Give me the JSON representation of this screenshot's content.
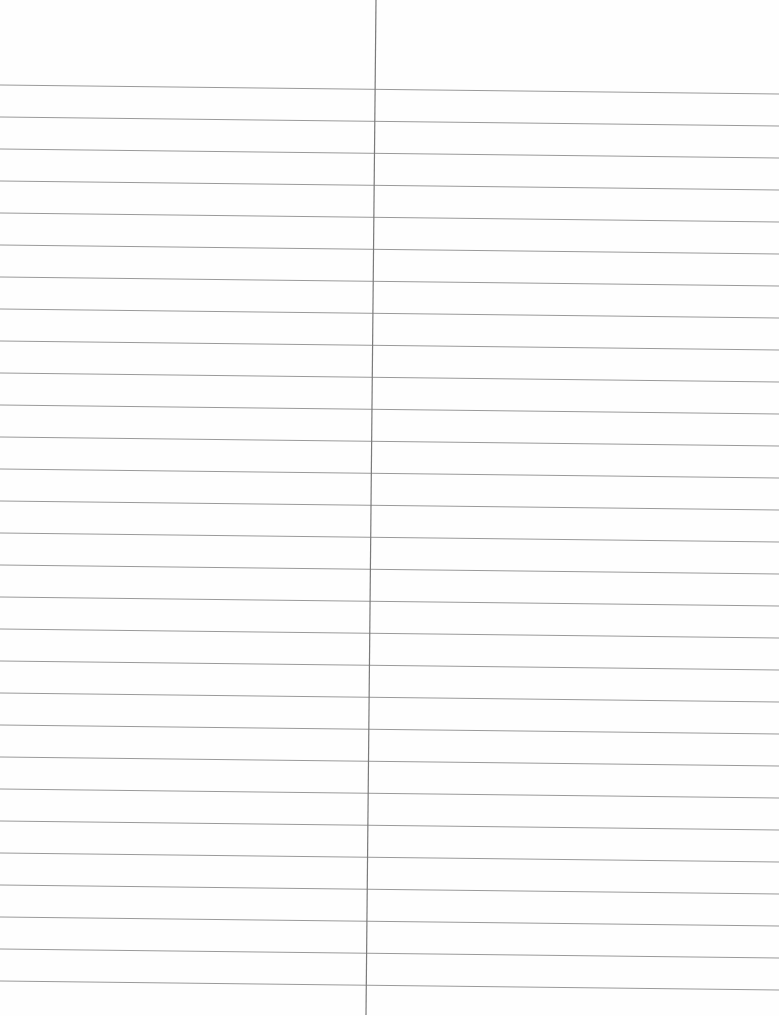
{
  "page": {
    "type": "ruled-notebook-page",
    "columns": 2,
    "text_content": [],
    "rule_count": 29,
    "rule_first_y_left": 85,
    "rule_first_y_right": 94,
    "rule_spacing": 32,
    "divider": {
      "top_x": 376,
      "bottom_x": 366,
      "top_y": 0,
      "bottom_y": 1015
    },
    "colors": {
      "paper": "#fefefe",
      "rule": "#9a9a9a",
      "divider": "#7a7a7a"
    }
  }
}
